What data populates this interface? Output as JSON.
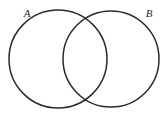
{
  "figure": {
    "name": "venn-diagram-two-sets",
    "type": "venn-diagram",
    "width": 167,
    "height": 114,
    "background_color": "#ffffff",
    "stroke_color": "#2b2b2b",
    "stroke_width": 1.5,
    "fill": "none",
    "shaded_regions": []
  },
  "sets": [
    {
      "id": "A",
      "label": "A",
      "label_x": 27,
      "label_y": 14,
      "center_x": 58,
      "center_y": 59,
      "radius": 49
    },
    {
      "id": "B",
      "label": "B",
      "label_x": 149,
      "label_y": 14,
      "center_x": 111,
      "center_y": 59,
      "radius": 48
    }
  ],
  "intersections": [
    {
      "name": "upper-intersection-point",
      "x": 85,
      "y": 21
    },
    {
      "name": "lower-intersection-point",
      "x": 85,
      "y": 98
    }
  ]
}
